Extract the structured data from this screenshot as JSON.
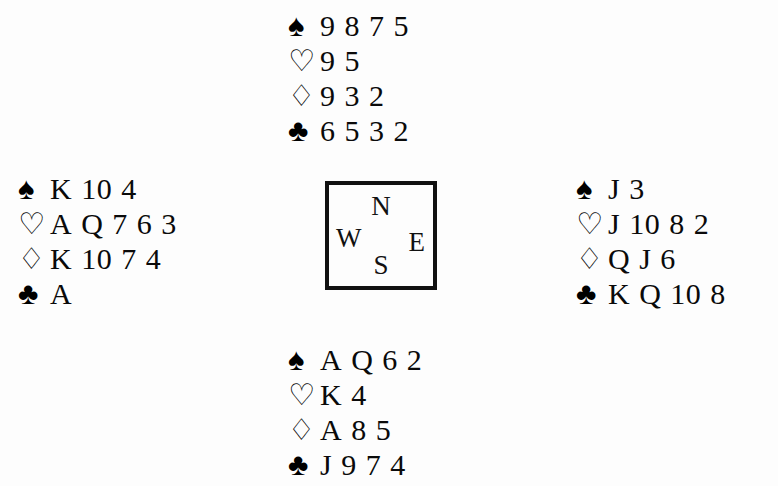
{
  "diagram": {
    "type": "bridge-deal",
    "background_color": "#fdfdfd",
    "ink_color": "#0a0a0a"
  },
  "suits": {
    "spades": {
      "name": "spade-suit-symbol",
      "glyph": "♠",
      "style": "solid"
    },
    "hearts": {
      "name": "heart-suit-symbol",
      "glyph": "♡",
      "style": "hollow"
    },
    "diamonds": {
      "name": "diamond-suit-symbol",
      "glyph": "♢",
      "style": "hollow"
    },
    "clubs": {
      "name": "club-suit-symbol",
      "glyph": "♣",
      "style": "solid"
    }
  },
  "compass": {
    "north_label": "N",
    "west_label": "W",
    "east_label": "E",
    "south_label": "S"
  },
  "hands": {
    "north": {
      "position": "North",
      "spades": "9 8 7 5",
      "hearts": "9 5",
      "diamonds": "9 3 2",
      "clubs": "6 5 3 2"
    },
    "west": {
      "position": "West",
      "spades": "K 10 4",
      "hearts": "A Q 7 6 3",
      "diamonds": "K 10 7 4",
      "clubs": "A"
    },
    "east": {
      "position": "East",
      "spades": "J 3",
      "hearts": "J 10 8 2",
      "diamonds": "Q J 6",
      "clubs": "K Q 10 8"
    },
    "south": {
      "position": "South",
      "spades": "A Q 6 2",
      "hearts": "K 4",
      "diamonds": "A 8 5",
      "clubs": "J 9 7 4"
    }
  }
}
